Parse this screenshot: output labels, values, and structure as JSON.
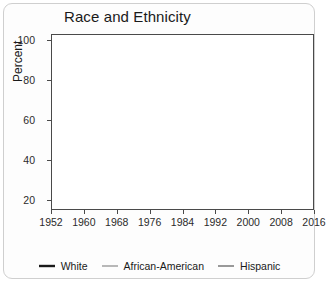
{
  "chart_data": {
    "type": "line",
    "title": "Race and Ethnicity",
    "xlabel": "",
    "ylabel": "Percent",
    "ylim": [
      15,
      103
    ],
    "xlim": [
      1952,
      2016
    ],
    "yticks": [
      20,
      40,
      60,
      80,
      100
    ],
    "xticks": [
      1952,
      1960,
      1968,
      1976,
      1984,
      1992,
      2000,
      2008,
      2016
    ],
    "grid": true,
    "legend_position": "bottom",
    "x": [
      1952,
      1956,
      1960,
      1964,
      1968,
      1972,
      1976,
      1980,
      1984,
      1988,
      1992,
      1996,
      2000,
      2004,
      2008,
      2012,
      2016
    ],
    "series": [
      {
        "name": "White",
        "color": "#1a1a1a",
        "width": 2.1,
        "values": [
          40,
          39,
          48,
          64,
          36,
          30,
          45,
          32,
          35,
          38,
          41,
          45,
          44,
          41,
          42,
          40,
          38
        ]
      },
      {
        "name": "African-American",
        "color": "#9a9a9a",
        "width": 1.1,
        "values": [
          80,
          64,
          70,
          100,
          96,
          86,
          94,
          93,
          90,
          90,
          91,
          97,
          91,
          88,
          99,
          98,
          88
        ]
      },
      {
        "name": "Hispanic",
        "color": "#6e6e6e",
        "width": 1.1,
        "start_index": 7,
        "values": [
          null,
          null,
          null,
          null,
          null,
          null,
          null,
          56,
          52,
          65,
          58,
          80,
          55,
          62,
          72,
          74,
          62
        ]
      }
    ]
  },
  "legend": {
    "items": [
      {
        "label": "White",
        "color": "#1a1a1a",
        "width": 2.4
      },
      {
        "label": "African-American",
        "color": "#9a9a9a",
        "width": 1.4
      },
      {
        "label": "Hispanic",
        "color": "#6e6e6e",
        "width": 1.4
      }
    ]
  }
}
